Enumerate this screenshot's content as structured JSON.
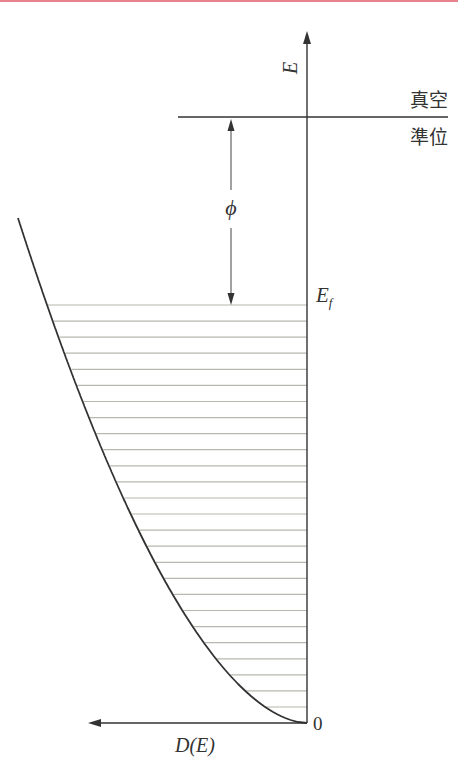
{
  "diagram": {
    "colors": {
      "accent_rule": "#e8828f",
      "axis": "#333333",
      "hatch": "#b8b8ae",
      "curve": "#333333"
    },
    "labels": {
      "energy_axis": "E",
      "vacuum_level_top": "真空",
      "vacuum_level_bottom": "準位",
      "work_function": "ϕ",
      "fermi_level_main": "E",
      "fermi_level_sub": "f",
      "origin": "0",
      "dos_axis": "D(E)"
    },
    "hatch_line_count": 26
  }
}
